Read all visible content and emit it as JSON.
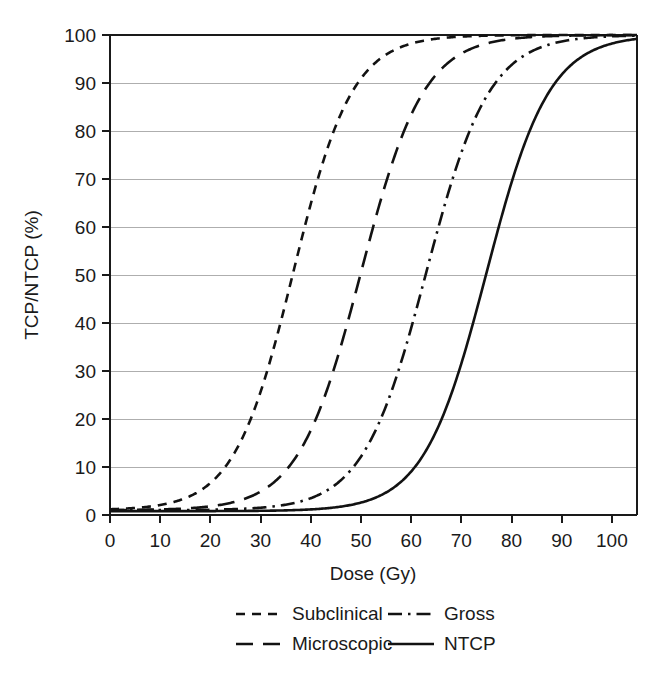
{
  "chart_data": {
    "type": "line",
    "title": "",
    "xlabel": "Dose (Gy)",
    "ylabel": "TCP/NTCP (%)",
    "xlim": [
      0,
      105
    ],
    "ylim": [
      0,
      100
    ],
    "xticks": [
      0,
      10,
      20,
      30,
      40,
      50,
      60,
      70,
      80,
      90,
      100
    ],
    "yticks": [
      0,
      10,
      20,
      30,
      40,
      50,
      60,
      70,
      80,
      90,
      100
    ],
    "xtick_labels": [
      "0",
      "10",
      "20",
      "30",
      "40",
      "50",
      "60",
      "70",
      "80",
      "90",
      "100"
    ],
    "ytick_labels": [
      "0",
      "10",
      "20",
      "30",
      "40",
      "50",
      "60",
      "70",
      "80",
      "90",
      "100"
    ],
    "grid": "horizontal",
    "legend_position": "below",
    "line_color": "#121212",
    "grid_color": "#aeaeae",
    "x": [
      0,
      5,
      10,
      15,
      20,
      25,
      30,
      35,
      40,
      45,
      50,
      55,
      60,
      65,
      70,
      75,
      80,
      85,
      90,
      95,
      100,
      105
    ],
    "series": [
      {
        "name": "Subclinical",
        "dash": "short-dash",
        "dash_pattern": "9,7",
        "d50": 36.5,
        "gamma50": 1.55,
        "values": [
          1.0,
          1.2,
          1.6,
          2.4,
          3.8,
          6.3,
          11.0,
          19.5,
          32.5,
          48.5,
          64.5,
          77.5,
          86.5,
          92.0,
          95.4,
          97.3,
          98.4,
          99.0,
          99.3,
          99.6,
          99.7,
          99.8
        ]
      },
      {
        "name": "Microscopic",
        "dash": "long-dash",
        "dash_pattern": "17,10",
        "d50": 50.0,
        "gamma50": 2.0,
        "values": [
          1.0,
          1.0,
          1.1,
          1.3,
          1.8,
          2.7,
          4.3,
          7.2,
          12.3,
          20.5,
          32.5,
          47.0,
          61.5,
          73.5,
          82.5,
          88.8,
          92.8,
          95.4,
          97.0,
          98.0,
          98.7,
          99.1
        ]
      },
      {
        "name": "Gross",
        "dash": "dash-dot",
        "dash_pattern": "14,6,2.5,6",
        "d50": 63.0,
        "gamma50": 2.5,
        "values": [
          1.0,
          1.0,
          1.0,
          1.1,
          1.3,
          1.7,
          2.3,
          3.3,
          5.0,
          7.8,
          12.3,
          19.5,
          30.0,
          43.5,
          58.0,
          70.5,
          80.2,
          87.0,
          91.5,
          94.5,
          96.4,
          97.6
        ]
      },
      {
        "name": "NTCP",
        "dash": "solid",
        "dash_pattern": "none",
        "d50": 75.0,
        "gamma50": 3.0,
        "values": [
          0.8,
          0.8,
          0.9,
          1.0,
          1.1,
          1.3,
          1.7,
          2.2,
          3.0,
          4.2,
          6.0,
          8.8,
          13.2,
          20.0,
          30.0,
          43.0,
          57.0,
          69.5,
          79.5,
          86.5,
          91.5,
          94.8
        ]
      }
    ],
    "legend": [
      {
        "label": "Subclinical",
        "dash": "short-dash",
        "row": 0,
        "col": 0
      },
      {
        "label": "Gross",
        "dash": "dash-dot",
        "row": 0,
        "col": 1
      },
      {
        "label": "Microscopic",
        "dash": "long-dash",
        "row": 1,
        "col": 0
      },
      {
        "label": "NTCP",
        "dash": "solid",
        "row": 1,
        "col": 1
      }
    ]
  }
}
